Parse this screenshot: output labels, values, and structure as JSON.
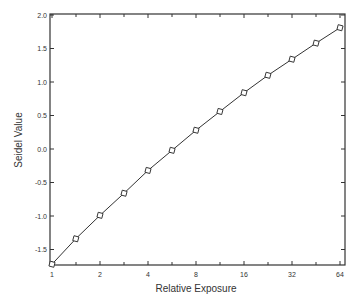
{
  "chart_data": {
    "type": "line",
    "title": "",
    "xlabel": "Relative Exposure",
    "ylabel": "Seidel Value",
    "xscale": "log2",
    "xlim": [
      1,
      64
    ],
    "ylim": [
      -1.75,
      2.0
    ],
    "x_ticks": [
      1,
      2,
      4,
      8,
      16,
      32,
      64
    ],
    "x_tick_labels": [
      "1",
      "2",
      "4",
      "8",
      "16",
      "32",
      "64"
    ],
    "y_ticks": [
      -1.5,
      -1.0,
      -0.5,
      0.0,
      0.5,
      1.0,
      1.5,
      2.0
    ],
    "y_tick_labels": [
      "-1.5",
      "-1.0",
      "-0.5",
      "0.0",
      "0.5",
      "1.0",
      "1.5",
      "2.0"
    ],
    "grid": false,
    "legend": null,
    "marker": "open-square",
    "series": [
      {
        "name": "Seidel value",
        "x": [
          1,
          1.41,
          2,
          2.83,
          4,
          5.66,
          8,
          11.3,
          16,
          22.6,
          32,
          45.3,
          64
        ],
        "values": [
          -1.72,
          -1.34,
          -0.99,
          -0.66,
          -0.32,
          -0.02,
          0.28,
          0.56,
          0.84,
          1.1,
          1.34,
          1.58,
          1.81
        ]
      }
    ]
  }
}
